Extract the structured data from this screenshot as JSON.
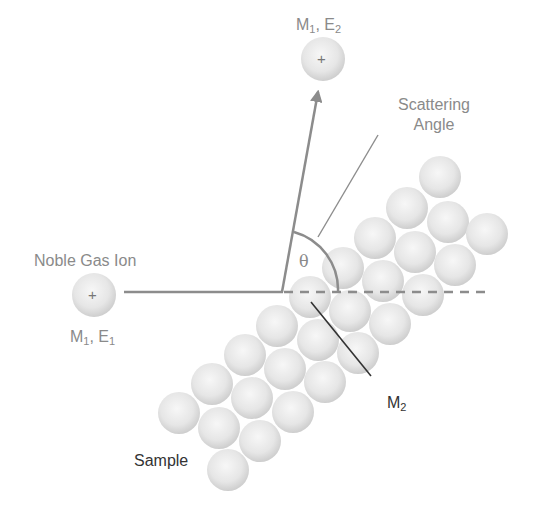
{
  "diagram": {
    "type": "ion-scattering-schematic",
    "labels": {
      "incident_ion_title": "Noble Gas Ion",
      "incident_ion_symbol": "+",
      "incident_ion_mass": "M",
      "incident_ion_mass_sub": "1",
      "incident_ion_energy": "E",
      "incident_ion_energy_sub": "1",
      "scattered_ion_symbol": "+",
      "scattered_ion_mass": "M",
      "scattered_ion_mass_sub": "1",
      "scattered_ion_energy": "E",
      "scattered_ion_energy_sub": "2",
      "scattering_angle_line1": "Scattering",
      "scattering_angle_line2": "Angle",
      "theta": "θ",
      "target_mass": "M",
      "target_mass_sub": "2",
      "sample": "Sample"
    },
    "colors": {
      "ray": "#8c8c8c",
      "leader_dark": "#333333",
      "leader_light": "#8c8c8c",
      "label_light": "#8a8a8a",
      "label_dark": "#333333",
      "sphere_light": "#f4f4f4",
      "sphere_dark": "#c9c9c9"
    },
    "geometry": {
      "incident_ion": {
        "cx": 94,
        "cy": 295,
        "r": 22
      },
      "scattered_ion": {
        "cx": 323,
        "cy": 59,
        "r": 22
      },
      "impact_point": {
        "x": 282,
        "y": 292
      },
      "sphere_radius": 21,
      "spheres": [
        [
          179,
          413
        ],
        [
          212,
          384
        ],
        [
          245,
          355
        ],
        [
          277,
          326
        ],
        [
          310,
          297
        ],
        [
          343,
          268
        ],
        [
          375,
          238
        ],
        [
          407,
          208
        ],
        [
          440,
          177
        ],
        [
          219,
          428
        ],
        [
          252,
          398
        ],
        [
          285,
          369
        ],
        [
          318,
          340
        ],
        [
          350,
          311
        ],
        [
          383,
          281
        ],
        [
          415,
          252
        ],
        [
          448,
          222
        ],
        [
          228,
          470
        ],
        [
          260,
          441
        ],
        [
          293,
          412
        ],
        [
          325,
          382
        ],
        [
          358,
          353
        ],
        [
          390,
          324
        ],
        [
          423,
          295
        ],
        [
          455,
          265
        ],
        [
          487,
          234
        ]
      ]
    }
  }
}
